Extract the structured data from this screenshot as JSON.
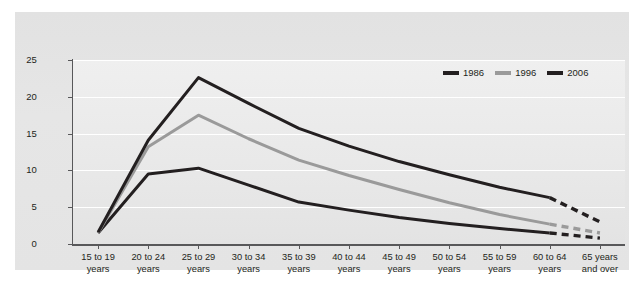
{
  "chart_data": {
    "type": "line",
    "title": "",
    "subtitle": "",
    "xlabel": "",
    "ylabel": "",
    "ylim": [
      0,
      25
    ],
    "yticks": [
      0,
      5,
      10,
      15,
      20,
      25
    ],
    "grid": true,
    "legend_position": "top-right",
    "categories": [
      "15 to 19 years",
      "20 to 24 years",
      "25 to 29 years",
      "30 to 34 years",
      "35 to 39 years",
      "40 to 44 years",
      "45 to 49 years",
      "50 to 54 years",
      "55 to 59 years",
      "60 to 64 years",
      "65 years and over"
    ],
    "series": [
      {
        "name": "1986",
        "color": "#231f20",
        "values": [
          1.5,
          9.5,
          10.3,
          8.0,
          5.7,
          4.6,
          3.6,
          2.8,
          2.1,
          1.5,
          0.8
        ],
        "dashed_from_index": 9
      },
      {
        "name": "1996",
        "color": "#9a9a9a",
        "values": [
          1.5,
          13.2,
          17.5,
          14.3,
          11.4,
          9.3,
          7.4,
          5.6,
          4.0,
          2.7,
          1.5
        ],
        "dashed_from_index": 9
      },
      {
        "name": "2006",
        "color": "#231f20",
        "values": [
          1.6,
          14.1,
          22.6,
          19.1,
          15.7,
          13.3,
          11.2,
          9.4,
          7.7,
          6.3,
          3.0
        ],
        "dashed_from_index": 9
      }
    ]
  },
  "axis": {
    "y_tick_labels": [
      "25",
      "20",
      "15",
      "10",
      "5",
      "0"
    ]
  },
  "x_tick_lines": [
    [
      "15 to 19",
      "years"
    ],
    [
      "20 to 24",
      "years"
    ],
    [
      "25 to 29",
      "years"
    ],
    [
      "30 to 34",
      "years"
    ],
    [
      "35 to 39",
      "years"
    ],
    [
      "40 to 44",
      "years"
    ],
    [
      "45 to 49",
      "years"
    ],
    [
      "50 to 54",
      "years"
    ],
    [
      "55 to 59",
      "years"
    ],
    [
      "60 to 64",
      "years"
    ],
    [
      "65 years",
      "and over"
    ]
  ],
  "legend": {
    "items": [
      {
        "label": "1986",
        "color": "#231f20"
      },
      {
        "label": "1996",
        "color": "#9a9a9a"
      },
      {
        "label": "2006",
        "color": "#231f20"
      }
    ]
  },
  "colors": {
    "panel_background": "#e4e4e4",
    "plot_background": "#eaeaea",
    "gridline": "#ffffff",
    "axis": "#58585a",
    "text": "#231f20"
  }
}
